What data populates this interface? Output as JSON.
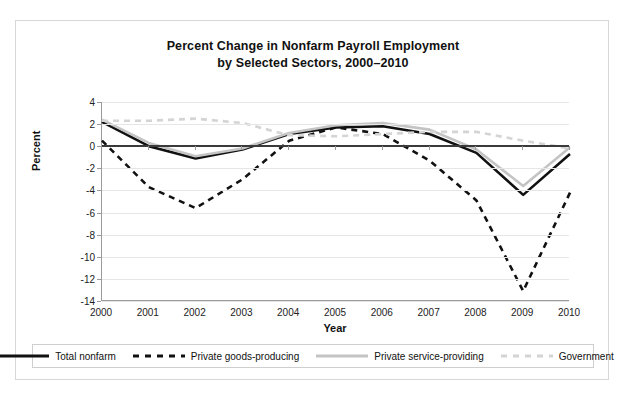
{
  "top_clip_text": "",
  "chart_data": {
    "type": "line",
    "title": "Percent Change in Nonfarm Payroll Employment by Selected Sectors, 2000–2010",
    "title_line1": "Percent Change in Nonfarm Payroll Employment",
    "title_line2": "by Selected Sectors, 2000–2010",
    "xlabel": "Year",
    "ylabel": "Percent",
    "categories": [
      "2000",
      "2001",
      "2002",
      "2003",
      "2004",
      "2005",
      "2006",
      "2007",
      "2008",
      "2009",
      "2010"
    ],
    "x": [
      2000,
      2001,
      2002,
      2003,
      2004,
      2005,
      2006,
      2007,
      2008,
      2009,
      2010
    ],
    "xlim": [
      2000,
      2010
    ],
    "ylim": [
      -14,
      4
    ],
    "yticks": [
      4,
      2,
      0,
      -2,
      -4,
      -6,
      -8,
      -10,
      -12,
      -14
    ],
    "ytick_labels": [
      "4",
      "2",
      "0",
      "-2",
      "-4",
      "-6",
      "-8",
      "-10",
      "-12",
      "-14"
    ],
    "grid": true,
    "legend_position": "bottom",
    "zero_reference_line": 0,
    "series": [
      {
        "name": "Total nonfarm",
        "style": "solid",
        "color": "#111111",
        "width": 2.6,
        "values": [
          2.2,
          0.0,
          -1.1,
          -0.3,
          1.1,
          1.7,
          1.8,
          1.1,
          -0.6,
          -4.4,
          -0.7
        ]
      },
      {
        "name": "Private goods-producing",
        "style": "dashed",
        "color": "#111111",
        "width": 2.6,
        "values": [
          0.5,
          -3.7,
          -5.6,
          -3.0,
          0.5,
          1.7,
          1.1,
          -1.3,
          -4.9,
          -13.1,
          -4.2
        ]
      },
      {
        "name": "Private service-providing",
        "style": "solid",
        "color": "#c4c4c4",
        "width": 2.6,
        "values": [
          2.4,
          0.3,
          -0.9,
          -0.2,
          1.2,
          1.9,
          2.1,
          1.5,
          -0.3,
          -3.6,
          -0.1
        ]
      },
      {
        "name": "Government",
        "style": "dashed",
        "color": "#d4d4d4",
        "width": 2.6,
        "values": [
          2.3,
          2.3,
          2.5,
          2.1,
          1.0,
          0.9,
          1.1,
          1.3,
          1.3,
          0.5,
          -0.2
        ]
      }
    ]
  }
}
